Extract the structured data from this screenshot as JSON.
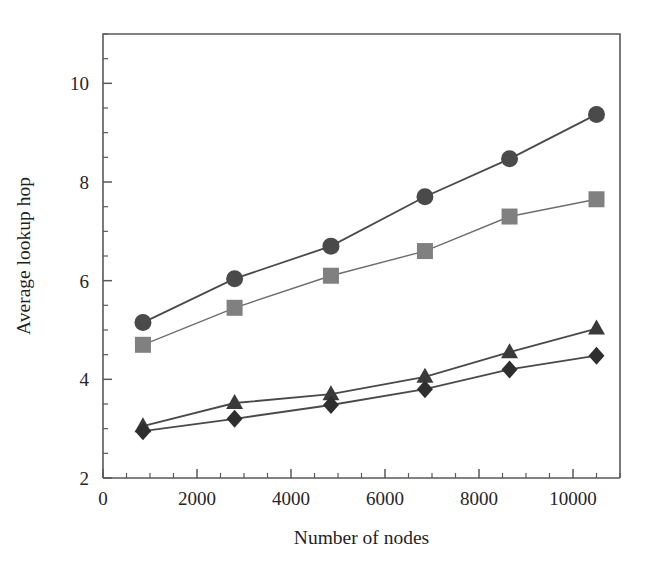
{
  "chart_data": {
    "type": "line",
    "title": "",
    "xlabel": "Number of nodes",
    "ylabel": "Average lookup hop",
    "xlim": [
      0,
      11000
    ],
    "ylim": [
      2,
      11
    ],
    "grid": false,
    "legend": "none",
    "x": [
      850,
      2800,
      4850,
      6850,
      8650,
      10500
    ],
    "x_ticks": [
      0,
      2000,
      4000,
      6000,
      8000,
      10000
    ],
    "x_tick_labels": [
      "0",
      "2000",
      "4000",
      "6000",
      "8000",
      "10000"
    ],
    "x_minor_step": 500,
    "y_ticks": [
      2,
      4,
      6,
      8,
      10
    ],
    "y_tick_labels": [
      "2",
      "4",
      "6",
      "8",
      "10"
    ],
    "y_minor_step": 0.5,
    "series": [
      {
        "name": "circle-series",
        "marker": "circle",
        "color": "#4a4a4a",
        "values": [
          5.15,
          6.04,
          6.7,
          7.7,
          8.47,
          9.37
        ]
      },
      {
        "name": "square-series",
        "marker": "square",
        "color": "#808080",
        "values": [
          4.7,
          5.45,
          6.1,
          6.6,
          7.3,
          7.65
        ]
      },
      {
        "name": "triangle-series",
        "marker": "triangle",
        "color": "#3a3a3a",
        "values": [
          3.05,
          3.52,
          3.7,
          4.05,
          4.55,
          5.03
        ]
      },
      {
        "name": "diamond-series",
        "marker": "diamond",
        "color": "#2e2e2e",
        "values": [
          2.95,
          3.2,
          3.48,
          3.8,
          4.2,
          4.48
        ]
      }
    ]
  },
  "figure": {
    "background": "#ffffff",
    "axis_color": "#595959"
  }
}
